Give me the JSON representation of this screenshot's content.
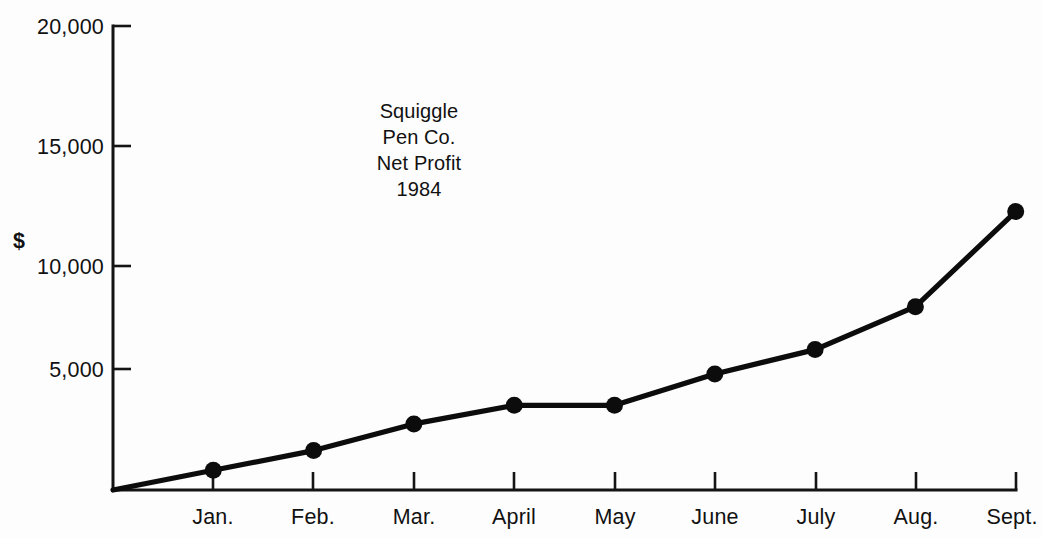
{
  "chart_data": {
    "type": "line",
    "title": "Squiggle Pen Co. Net Profit 1984",
    "title_lines": [
      "Squiggle",
      "Pen Co.",
      "Net Profit",
      "1984"
    ],
    "xlabel": "",
    "ylabel": "$",
    "categories": [
      "",
      "Jan.",
      "Feb.",
      "Mar.",
      "April",
      "May",
      "June",
      "July",
      "Aug.",
      "Sept."
    ],
    "values": [
      0,
      850,
      1700,
      2850,
      3650,
      3650,
      5000,
      6050,
      7900,
      12000
    ],
    "series": [
      {
        "name": "Net Profit",
        "values": [
          0,
          850,
          1700,
          2850,
          3650,
          3650,
          5000,
          6050,
          7900,
          12000
        ]
      }
    ],
    "ylim": [
      0,
      20000
    ],
    "y_ticks": [
      5000,
      10000,
      15000,
      20000
    ],
    "y_tick_labels": [
      "5,000",
      "10,000",
      "15,000",
      "20,000"
    ],
    "x_tick_labels": [
      "Jan.",
      "Feb.",
      "Mar.",
      "April",
      "May",
      "June",
      "July",
      "Aug.",
      "Sept."
    ],
    "grid": false,
    "legend": false,
    "marker": "filled-circle",
    "line_color": "#0c0c0c",
    "background_color": "#fdfdfd"
  },
  "axis": {
    "unit_label": "$"
  },
  "title": {
    "line1": "Squiggle",
    "line2": "Pen Co.",
    "line3": "Net Profit",
    "line4": "1984"
  },
  "y_labels": {
    "t20000": "20,000",
    "t15000": "15,000",
    "t10000": "10,000",
    "t5000": "5,000"
  },
  "x_labels": {
    "jan": "Jan.",
    "feb": "Feb.",
    "mar": "Mar.",
    "april": "April",
    "may": "May",
    "june": "June",
    "july": "July",
    "aug": "Aug.",
    "sept": "Sept."
  }
}
